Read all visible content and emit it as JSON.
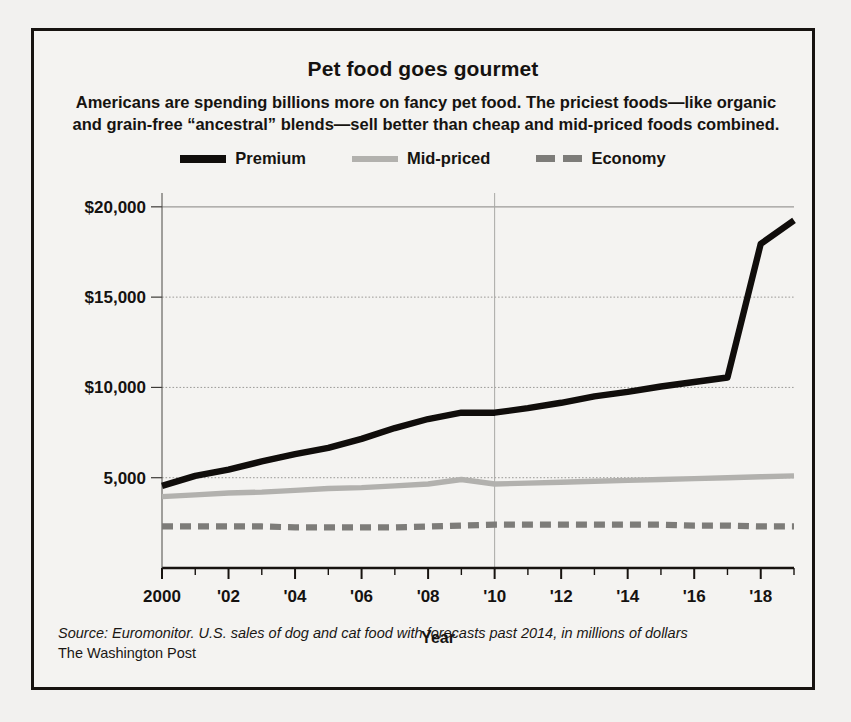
{
  "figure": {
    "title": "Pet food goes gourmet",
    "subtitle": "Americans are spending billions more on fancy pet food. The priciest foods—like organic and grain-free “ancestral” blends—sell better than cheap and mid-priced foods combined.",
    "source": "Source: Euromonitor. U.S. sales of dog and cat food with forecasts past 2014, in millions of dollars",
    "outlet": "The Washington Post"
  },
  "legend": {
    "position": "top-center",
    "items": [
      {
        "label": "Premium",
        "swatch": "premium",
        "color": "#100d0b",
        "style": "solid-thick"
      },
      {
        "label": "Mid-priced",
        "swatch": "mid",
        "color": "#b2b1ae",
        "style": "solid"
      },
      {
        "label": "Economy",
        "swatch": "econ",
        "color": "#7d7c79",
        "style": "dashed"
      }
    ]
  },
  "axes": {
    "xlabel": "Year",
    "ylabel": "",
    "yticks": [
      "$20,000",
      "$15,000",
      "$10,000",
      "5,000"
    ],
    "ytick_values": [
      20000,
      15000,
      10000,
      5000
    ],
    "xticks": [
      "2000",
      "'02",
      "'04",
      "'06",
      "'08",
      "'10",
      "'12",
      "'14",
      "'16",
      "'18"
    ],
    "xtick_values": [
      2000,
      2002,
      2004,
      2006,
      2008,
      2010,
      2012,
      2014,
      2016,
      2018
    ],
    "xlim": [
      2000,
      2019
    ],
    "ylim": [
      0,
      20600
    ],
    "grid": "horizontal-dotted"
  },
  "chart_data": {
    "type": "line",
    "title": "Pet food goes gourmet",
    "subtitle": "Americans are spending billions more on fancy pet food. The priciest foods—like organic and grain-free “ancestral” blends—sell better than cheap and mid-priced foods combined.",
    "xlabel": "Year",
    "ylabel": "U.S. sales, millions of dollars",
    "xlim": [
      2000,
      2019
    ],
    "ylim": [
      0,
      20600
    ],
    "grid": true,
    "legend": "top-center",
    "x": [
      2000,
      2001,
      2002,
      2003,
      2004,
      2005,
      2006,
      2007,
      2008,
      2009,
      2010,
      2011,
      2012,
      2013,
      2014,
      2015,
      2016,
      2017,
      2018,
      2019
    ],
    "series": [
      {
        "name": "Premium",
        "color": "#100d0b",
        "style": "solid",
        "values": [
          4550,
          5100,
          5450,
          5900,
          6300,
          6650,
          7150,
          7750,
          8250,
          8600,
          8600,
          8850,
          9150,
          9500,
          9750,
          10050,
          10300,
          10550,
          17950,
          19250
        ]
      },
      {
        "name": "Mid-priced",
        "color": "#b2b1ae",
        "style": "solid",
        "values": [
          3950,
          4050,
          4150,
          4200,
          4300,
          4400,
          4450,
          4550,
          4650,
          4900,
          4650,
          4700,
          4750,
          4800,
          4850,
          4900,
          4950,
          5000,
          5050,
          5100
        ]
      },
      {
        "name": "Economy",
        "color": "#7d7c79",
        "style": "dashed",
        "values": [
          2300,
          2300,
          2300,
          2300,
          2250,
          2250,
          2250,
          2250,
          2300,
          2350,
          2400,
          2400,
          2400,
          2400,
          2400,
          2400,
          2350,
          2350,
          2300,
          2300
        ]
      }
    ]
  }
}
